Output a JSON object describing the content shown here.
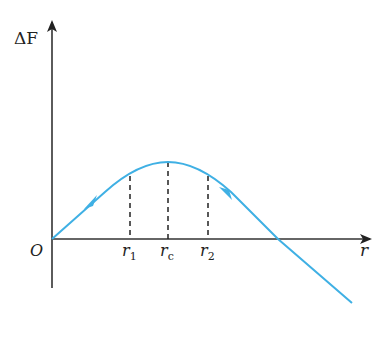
{
  "diagram": {
    "type": "energy-curve",
    "y_axis": {
      "label": "ΔF"
    },
    "x_axis": {
      "label": "r"
    },
    "origin": {
      "label": "O"
    },
    "markers": [
      {
        "id": "r1",
        "base": "r",
        "sub": "1"
      },
      {
        "id": "rc",
        "base": "r",
        "sub": "c"
      },
      {
        "id": "r2",
        "base": "r",
        "sub": "2"
      }
    ],
    "curve": {
      "color": "#3fb0e4",
      "description": "Rises from origin to maximum at r_c, then falls crossing the r-axis and continuing below",
      "arrows": [
        "toward origin on rising branch",
        "away from peak on falling branch"
      ]
    },
    "axis_color": "#222222"
  }
}
